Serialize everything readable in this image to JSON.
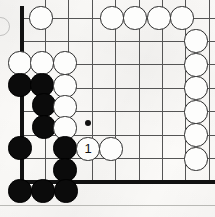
{
  "figure": {
    "kind": "go-board-diagram",
    "board": {
      "width_px": 215,
      "height_px": 217,
      "grid_spacing_px": 23.4,
      "origin_x_px": 22,
      "origin_y_px": 18,
      "columns": 9,
      "rows": 8,
      "line_color": "#555555",
      "edge_color": "#111111",
      "background_color": "#fbfaf8",
      "thin_line_width": 1,
      "edge_line_width": 3.2,
      "left_edge_x_px": 22,
      "bottom_edge_y_px": 182,
      "left_edge_top_y_px": 6,
      "left_edge_bottom_y_px": 182,
      "bottom_edge_right_x_px": 215
    },
    "hoshi_points": [
      {
        "name": "star-point-center",
        "x_px": 88,
        "y_px": 123,
        "diameter_px": 6
      }
    ],
    "page_rule": {
      "y_px": 205,
      "height_px": 1,
      "color": "#b9b9b5"
    },
    "edge_marks": [
      {
        "name": "left-margin-partial-stone",
        "x_px": -9,
        "y_px": 17,
        "size_px": 17
      }
    ],
    "stone_radius_px": 11.6,
    "stones": [
      {
        "id": "w-c1-r0",
        "color": "white",
        "label": "",
        "cx": 41,
        "cy": 18
      },
      {
        "id": "w-c4-r0",
        "color": "white",
        "label": "",
        "cx": 112,
        "cy": 18
      },
      {
        "id": "w-c5-r0",
        "color": "white",
        "label": "",
        "cx": 135,
        "cy": 18
      },
      {
        "id": "w-c6-r0",
        "color": "white",
        "label": "",
        "cx": 159,
        "cy": 18
      },
      {
        "id": "w-c7-r0",
        "color": "white",
        "label": "",
        "cx": 182,
        "cy": 18
      },
      {
        "id": "w-c8-r1",
        "color": "white",
        "label": "",
        "cx": 196,
        "cy": 41
      },
      {
        "id": "w-c8-r2",
        "color": "white",
        "label": "",
        "cx": 196,
        "cy": 65
      },
      {
        "id": "w-c8-r3",
        "color": "white",
        "label": "",
        "cx": 196,
        "cy": 88
      },
      {
        "id": "w-c8-r4",
        "color": "white",
        "label": "",
        "cx": 196,
        "cy": 112
      },
      {
        "id": "w-c8-r5",
        "color": "white",
        "label": "",
        "cx": 196,
        "cy": 135
      },
      {
        "id": "w-c8-r6",
        "color": "white",
        "label": "",
        "cx": 196,
        "cy": 159
      },
      {
        "id": "w-c0-r2",
        "color": "white",
        "label": "",
        "cx": 20,
        "cy": 63
      },
      {
        "id": "w-c1-r2",
        "color": "white",
        "label": "",
        "cx": 42,
        "cy": 63
      },
      {
        "id": "w-c2-r2",
        "color": "white",
        "label": "",
        "cx": 65,
        "cy": 63
      },
      {
        "id": "b-c0-r3",
        "color": "black",
        "label": "",
        "cx": 20,
        "cy": 85
      },
      {
        "id": "b-c1-r3",
        "color": "black",
        "label": "",
        "cx": 42,
        "cy": 85
      },
      {
        "id": "w-c2-r3",
        "color": "white",
        "label": "",
        "cx": 65,
        "cy": 86
      },
      {
        "id": "b-c1-r4",
        "color": "black",
        "label": "",
        "cx": 44,
        "cy": 105
      },
      {
        "id": "w-c2-r4",
        "color": "white",
        "label": "",
        "cx": 65,
        "cy": 107
      },
      {
        "id": "b-c1-r5",
        "color": "black",
        "label": "",
        "cx": 44,
        "cy": 127
      },
      {
        "id": "w-c2-r5",
        "color": "white",
        "label": "",
        "cx": 65,
        "cy": 128
      },
      {
        "id": "b-c0-r6",
        "color": "black",
        "label": "",
        "cx": 20,
        "cy": 148
      },
      {
        "id": "b-c2-r6",
        "color": "black",
        "label": "",
        "cx": 65,
        "cy": 148
      },
      {
        "id": "w-move-1",
        "color": "white",
        "label": "1",
        "cx": 88,
        "cy": 149
      },
      {
        "id": "w-c4-r6",
        "color": "white",
        "label": "",
        "cx": 111,
        "cy": 149
      },
      {
        "id": "b-c2-r7",
        "color": "black",
        "label": "",
        "cx": 65,
        "cy": 170
      },
      {
        "id": "b-c0-r8",
        "color": "black",
        "label": "",
        "cx": 20,
        "cy": 191
      },
      {
        "id": "b-c1-r8",
        "color": "black",
        "label": "",
        "cx": 43,
        "cy": 191
      },
      {
        "id": "b-c2-r8",
        "color": "black",
        "label": "",
        "cx": 66,
        "cy": 191
      }
    ],
    "move_labels": [
      {
        "number": "1",
        "player": "white",
        "stone_id": "w-move-1"
      }
    ]
  }
}
